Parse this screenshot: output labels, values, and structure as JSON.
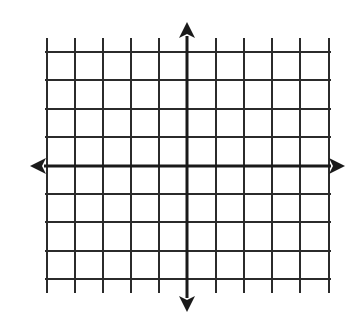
{
  "diagram": {
    "type": "coordinate-plane",
    "colors": {
      "background": "#ffffff",
      "grid_line": "#2b2b2b",
      "axis_line": "#1a1a1a"
    },
    "grid": {
      "vertical_lines_x": [
        47,
        75,
        103,
        131,
        159,
        216,
        244,
        272,
        300,
        329
      ],
      "horizontal_lines_y": [
        52,
        80,
        109,
        137,
        194,
        222,
        251,
        279
      ],
      "vertical_extent": [
        38,
        293
      ],
      "horizontal_extent": [
        45,
        331
      ],
      "line_width": 2
    },
    "x_axis": {
      "y": 166,
      "from_x": 30,
      "to_x": 345,
      "line_width": 3,
      "arrows": [
        "left",
        "right"
      ]
    },
    "y_axis": {
      "x": 187,
      "from_y": 22,
      "to_y": 312,
      "line_width": 3,
      "arrows": [
        "up",
        "down"
      ]
    },
    "units_left_of_origin": 5,
    "units_right_of_origin": 5,
    "units_above_origin": 4,
    "units_below_origin": 4
  }
}
